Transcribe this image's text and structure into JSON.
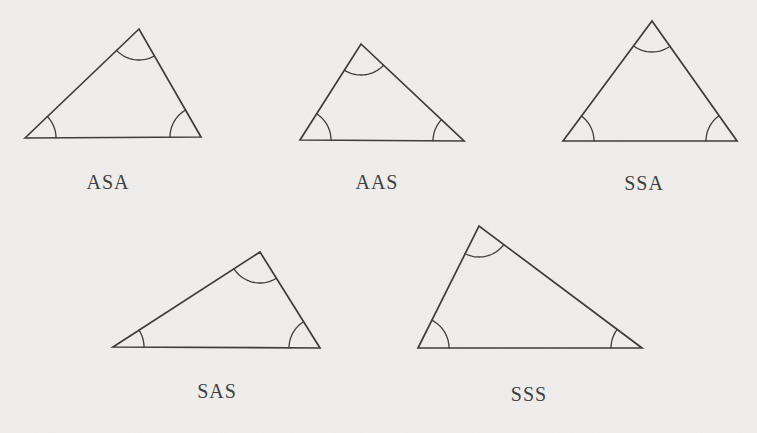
{
  "figure": {
    "background_color": "#efeeec",
    "line_color": "#3d3d3d",
    "label_color": "#3f3f3f",
    "angle_arc_radius": 31,
    "triangles": [
      {
        "label": "ASA",
        "vertices": [
          [
            25,
            138
          ],
          [
            139,
            29
          ],
          [
            201,
            137
          ]
        ],
        "label_pos": [
          108,
          189
        ],
        "angle_arcs": 3
      },
      {
        "label": "AAS",
        "vertices": [
          [
            300,
            140
          ],
          [
            361,
            44
          ],
          [
            464,
            141
          ]
        ],
        "label_pos": [
          377,
          189
        ],
        "angle_arcs": 3
      },
      {
        "label": "SSA",
        "vertices": [
          [
            563,
            141
          ],
          [
            652,
            21
          ],
          [
            737,
            141
          ]
        ],
        "label_pos": [
          644,
          190
        ],
        "angle_arcs": 3
      },
      {
        "label": "SAS",
        "vertices": [
          [
            113,
            347
          ],
          [
            260,
            252
          ],
          [
            320,
            348
          ]
        ],
        "label_pos": [
          217,
          398
        ],
        "angle_arcs": 3
      },
      {
        "label": "SSS",
        "vertices": [
          [
            418,
            348
          ],
          [
            479,
            226
          ],
          [
            642,
            348
          ]
        ],
        "label_pos": [
          529,
          401
        ],
        "angle_arcs": 3
      }
    ]
  }
}
